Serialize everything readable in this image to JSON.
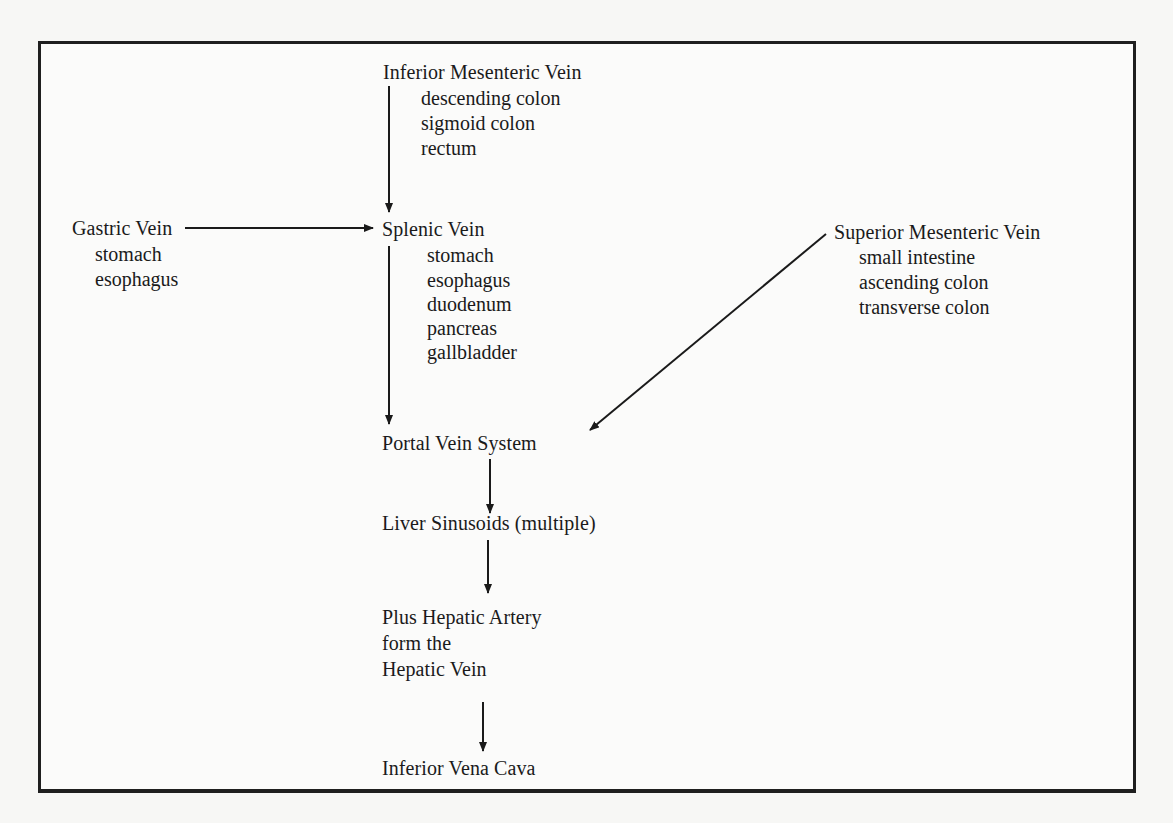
{
  "diagram": {
    "type": "flowchart",
    "nodes": {
      "inferior_mesenteric": {
        "title": "Inferior Mesenteric Vein",
        "items": [
          "descending colon",
          "sigmoid colon",
          "rectum"
        ]
      },
      "gastric": {
        "title": "Gastric Vein",
        "items": [
          "stomach",
          "esophagus"
        ]
      },
      "splenic": {
        "title": "Splenic Vein",
        "items": [
          "stomach",
          "esophagus",
          "duodenum",
          "pancreas",
          "gallbladder"
        ]
      },
      "superior_mesenteric": {
        "title": "Superior Mesenteric Vein",
        "items": [
          "small intestine",
          "ascending colon",
          "transverse colon"
        ]
      },
      "portal": {
        "title": "Portal Vein System"
      },
      "sinusoids": {
        "title": "Liver Sinusoids (multiple)"
      },
      "hepatic": {
        "lines": [
          "Plus Hepatic Artery",
          "form the",
          "Hepatic Vein"
        ]
      },
      "ivc": {
        "title": "Inferior Vena Cava"
      }
    },
    "edges": [
      {
        "from": "Inferior Mesenteric Vein",
        "to": "Splenic Vein"
      },
      {
        "from": "Gastric Vein",
        "to": "Splenic Vein"
      },
      {
        "from": "Splenic Vein",
        "to": "Portal Vein System"
      },
      {
        "from": "Superior Mesenteric Vein",
        "to": "Portal Vein System"
      },
      {
        "from": "Portal Vein System",
        "to": "Liver Sinusoids (multiple)"
      },
      {
        "from": "Liver Sinusoids (multiple)",
        "to": "Hepatic Vein"
      },
      {
        "from": "Hepatic Vein",
        "to": "Inferior Vena Cava"
      }
    ],
    "colors": {
      "ink": "#1a1a1a",
      "paper": "#fbfbfa",
      "border": "#1f1f1f"
    }
  }
}
